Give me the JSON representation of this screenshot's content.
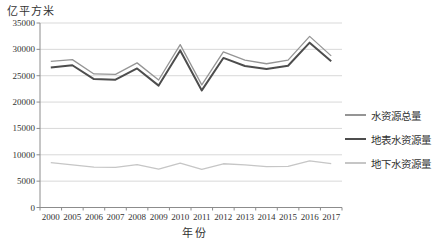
{
  "chart_data": {
    "type": "line",
    "title": "",
    "ylabel": "亿平方米",
    "xlabel": "年份",
    "categories": [
      "2000",
      "2005",
      "2006",
      "2007",
      "2008",
      "2009",
      "2010",
      "2011",
      "2012",
      "2013",
      "2014",
      "2015",
      "2016",
      "2017"
    ],
    "series": [
      {
        "name": "水资源总量",
        "color": "#959595",
        "line_width": 1.3,
        "values": [
          27701,
          28053,
          25330,
          25255,
          27434,
          24180,
          30906,
          23257,
          29529,
          27958,
          27267,
          27963,
          32466,
          28761
        ]
      },
      {
        "name": "地表水资源量",
        "color": "#4d4d4d",
        "line_width": 2,
        "values": [
          26562,
          26982,
          24358,
          24242,
          26377,
          23125,
          29798,
          22214,
          28373,
          26840,
          26264,
          26901,
          31274,
          27747
        ]
      },
      {
        "name": "地下水资源量",
        "color": "#c6c6c6",
        "line_width": 1.3,
        "values": [
          8502,
          8091,
          7643,
          7617,
          8122,
          7267,
          8417,
          7215,
          8296,
          8081,
          7745,
          7797,
          8854,
          8310
        ]
      }
    ],
    "ylim": [
      0,
      35000
    ],
    "ytick_step": 5000,
    "grid": true,
    "legend_position": "right",
    "grid_color": "#d9d9d9",
    "axis_color": "#8c8c8c",
    "text_color": "#333333"
  }
}
